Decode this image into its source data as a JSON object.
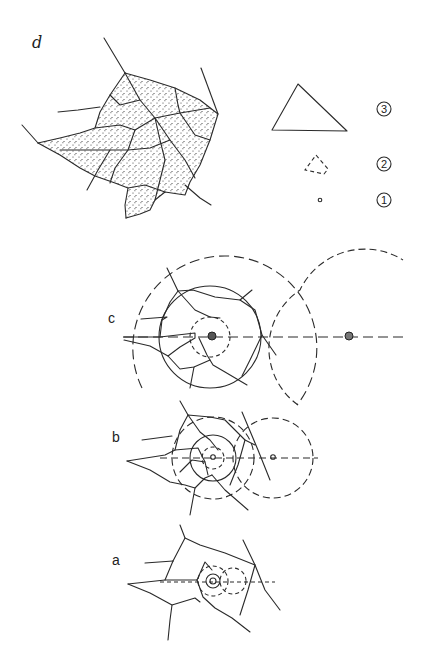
{
  "figure": {
    "panels": [
      {
        "id": "d",
        "label": "d",
        "description": "stippled polygonal plate network"
      },
      {
        "id": "c",
        "label": "c",
        "description": "large dashed and solid concentric circles around center with second center to the right"
      },
      {
        "id": "b",
        "label": "b",
        "description": "medium concentric circles around center with second center to the right"
      },
      {
        "id": "a",
        "label": "a",
        "description": "small concentric circles around center with second center to the right"
      }
    ],
    "legend": [
      {
        "number": "3",
        "shape": "large triangle",
        "style": "solid"
      },
      {
        "number": "2",
        "shape": "medium triangle",
        "style": "dashed"
      },
      {
        "number": "1",
        "shape": "small dot",
        "style": "solid"
      }
    ]
  },
  "labels": {
    "d": "d",
    "c": "c",
    "b": "b",
    "a": "a",
    "n3": "3",
    "n2": "2",
    "n1": "1"
  },
  "colors": {
    "ink": "#2a2a2a",
    "background": "#ffffff"
  }
}
